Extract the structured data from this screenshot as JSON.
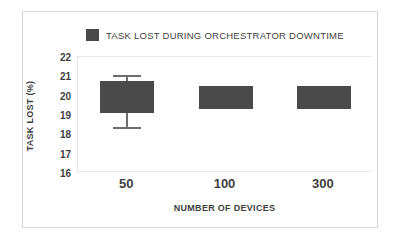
{
  "legend": {
    "label": "TASK LOST DURING ORCHESTRATOR DOWNTIME",
    "swatch_color": "#4a4a4a",
    "icon": "legend-square-icon"
  },
  "axes": {
    "ylabel": "TASK LOST (%)",
    "xlabel": "NUMBER OF DEVICES",
    "yticks": [
      "22",
      "21",
      "20",
      "19",
      "18",
      "17",
      "16"
    ],
    "xticks": [
      "50",
      "100",
      "300"
    ]
  },
  "colors": {
    "bar": "#4a4a4a",
    "whisker": "#6d6d6d",
    "frame": "#d9d9d9",
    "plot_border": "#e8e8e8",
    "text": "#3f3f3f",
    "background": "#ffffff"
  },
  "chart_data": {
    "type": "bar",
    "title": "",
    "xlabel": "NUMBER OF DEVICES",
    "ylabel": "TASK LOST (%)",
    "ylim": [
      16,
      22
    ],
    "ytick_step": 1,
    "grid": false,
    "legend_position": "top-center",
    "categories": [
      "50",
      "100",
      "300"
    ],
    "series": [
      {
        "name": "TASK LOST DURING ORCHESTRATOR DOWNTIME",
        "boxes": [
          {
            "category": "50",
            "top": 20.75,
            "bottom": 19.1,
            "whisker_high": 21.05,
            "whisker_low": 18.3
          },
          {
            "category": "100",
            "top": 20.5,
            "bottom": 19.3,
            "whisker_high": null,
            "whisker_low": null
          },
          {
            "category": "300",
            "top": 20.5,
            "bottom": 19.3,
            "whisker_high": null,
            "whisker_low": null
          }
        ],
        "values": [
          19.9,
          19.9,
          19.9
        ]
      }
    ]
  }
}
